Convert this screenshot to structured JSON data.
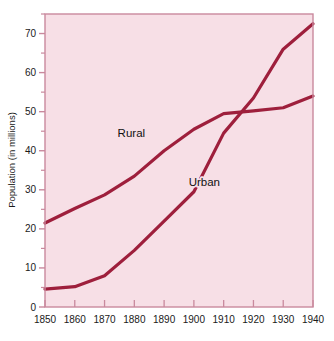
{
  "chart_data": {
    "type": "line",
    "title": "",
    "subtitle": "",
    "xlabel": "",
    "ylabel": "Population (in millions)",
    "xlim": [
      1850,
      1940
    ],
    "ylim": [
      0,
      75
    ],
    "grid": false,
    "legend_position": "inline-annotations",
    "x_ticks": [
      1850,
      1860,
      1870,
      1880,
      1890,
      1900,
      1910,
      1920,
      1930,
      1940
    ],
    "x_tick_labels": [
      "1850",
      "1860",
      "1870",
      "1880",
      "1890",
      "1900",
      "1910",
      "1920",
      "1930",
      "1940"
    ],
    "y_ticks": [
      0,
      10,
      20,
      30,
      40,
      50,
      60,
      70
    ],
    "y_tick_labels": [
      "0",
      "10",
      "20",
      "30",
      "40",
      "50",
      "60",
      "70"
    ],
    "y_minor_ticks": [
      5,
      15,
      25,
      35,
      45,
      55,
      65,
      75
    ],
    "x": [
      1850,
      1860,
      1870,
      1880,
      1890,
      1900,
      1910,
      1920,
      1930,
      1940
    ],
    "series": [
      {
        "name": "Rural",
        "color": "#9e1f3c",
        "values": [
          21.5,
          25.2,
          28.7,
          33.5,
          40.0,
          45.5,
          49.5,
          50.2,
          51.0,
          54.0
        ],
        "label_x": 1879,
        "label_y": 43.5
      },
      {
        "name": "Urban",
        "color": "#9e1f3c",
        "values": [
          4.6,
          5.2,
          8.0,
          14.5,
          22.0,
          29.5,
          44.5,
          53.5,
          66.0,
          72.5
        ],
        "label_x": 1903.5,
        "label_y": 31.0
      }
    ],
    "annotations": [
      {
        "text": "Rural",
        "x": 1879,
        "y": 43.5
      },
      {
        "text": "Urban",
        "x": 1903.5,
        "y": 31.0
      }
    ],
    "colors": {
      "line": "#9e1f3c",
      "plot_background": "#f7dfe6",
      "plot_border": "#c9899d",
      "page_background": "#ffffff",
      "text": "#1a1a1a"
    }
  }
}
